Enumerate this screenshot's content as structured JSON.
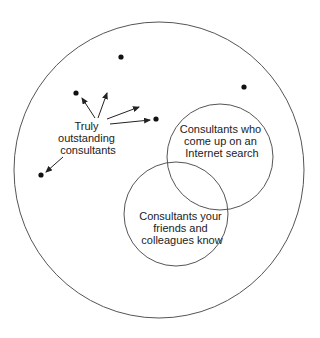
{
  "diagram": {
    "colors": {
      "background": "#ffffff",
      "stroke": "#555555",
      "dot": "#111111",
      "text": "#222222"
    },
    "universe_circle": {
      "cx": 159,
      "cy": 170,
      "rx": 145,
      "ry": 148
    },
    "internet_circle": {
      "cx": 220,
      "cy": 157,
      "r": 53,
      "label_lines": [
        "Consultants who",
        "come up on an",
        "Internet search"
      ]
    },
    "friends_circle": {
      "cx": 176,
      "cy": 214,
      "r": 52,
      "label_lines": [
        "Consultants your",
        "friends and",
        "colleagues know"
      ]
    },
    "outstanding_label": {
      "lines": [
        "Truly",
        "outstanding",
        "consultants"
      ]
    },
    "dots": [
      {
        "x": 76,
        "y": 93
      },
      {
        "x": 121,
        "y": 57
      },
      {
        "x": 244,
        "y": 87
      },
      {
        "x": 156,
        "y": 119
      },
      {
        "x": 41,
        "y": 175
      }
    ],
    "arrows": [
      {
        "x1": 95,
        "y1": 118,
        "x2": 82,
        "y2": 98
      },
      {
        "x1": 98,
        "y1": 118,
        "x2": 107,
        "y2": 93
      },
      {
        "x1": 107,
        "y1": 119,
        "x2": 139,
        "y2": 107
      },
      {
        "x1": 110,
        "y1": 124,
        "x2": 150,
        "y2": 120
      },
      {
        "x1": 63,
        "y1": 157,
        "x2": 46,
        "y2": 172
      }
    ]
  }
}
